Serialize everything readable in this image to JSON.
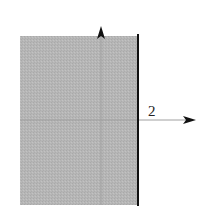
{
  "diagram": {
    "boundary_label": "2",
    "colors": {
      "region_fill": "#b4b4b4",
      "boundary_line": "#111111",
      "axis": "#999999",
      "arrowhead": "#111111"
    }
  }
}
